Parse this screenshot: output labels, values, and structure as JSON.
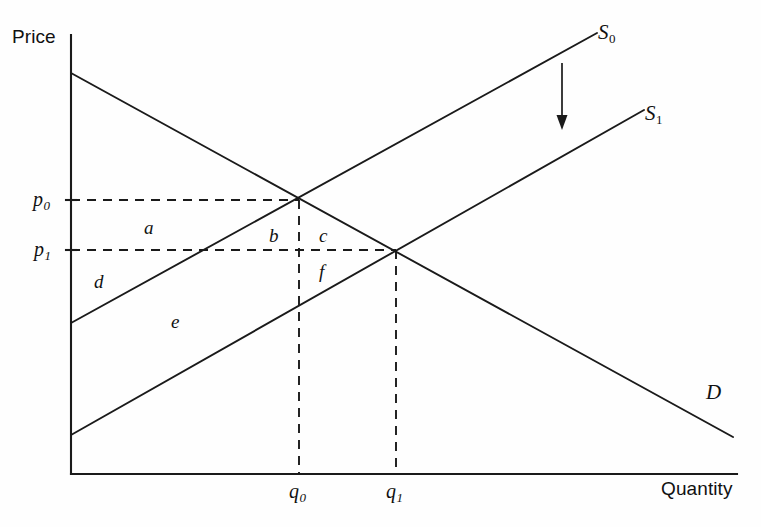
{
  "figure": {
    "background_color": "#fefefe",
    "line_color": "#1a1a1a"
  },
  "axes": {
    "y_label": "Price",
    "x_label": "Quantity",
    "origin": {
      "x": 71,
      "y": 474
    },
    "y_top": 35,
    "x_right": 737
  },
  "price_ticks": [
    {
      "key": "p0",
      "base": "p",
      "sub": "0",
      "y": 200
    },
    {
      "key": "p1",
      "base": "p",
      "sub": "1",
      "y": 250
    }
  ],
  "quantity_ticks": [
    {
      "key": "q0",
      "base": "q",
      "sub": "0",
      "x": 299
    },
    {
      "key": "q1",
      "base": "q",
      "sub": "1",
      "x": 396
    }
  ],
  "curves": [
    {
      "key": "supply0",
      "base": "S",
      "sub": "0",
      "label": "S0",
      "label_x": 598,
      "label_y": 22,
      "x1": 71,
      "y1": 323,
      "x2": 597,
      "y2": 33
    },
    {
      "key": "supply1",
      "base": "S",
      "sub": "1",
      "label": "S1",
      "label_x": 645,
      "label_y": 103,
      "x1": 71,
      "y1": 435,
      "x2": 644,
      "y2": 110
    },
    {
      "key": "demand",
      "base": "D",
      "sub": "",
      "label": "D",
      "label_x": 706,
      "label_y": 382,
      "x1": 71,
      "y1": 73,
      "x2": 733,
      "y2": 437
    }
  ],
  "equilibria": [
    {
      "key": "e0",
      "x": 299,
      "y": 200,
      "price": "p0",
      "quantity": "q0"
    },
    {
      "key": "e1",
      "x": 396,
      "y": 250,
      "price": "p1",
      "quantity": "q1"
    }
  ],
  "regions": [
    {
      "key": "a",
      "label": "a",
      "x": 144,
      "y": 218
    },
    {
      "key": "b",
      "label": "b",
      "x": 269,
      "y": 226
    },
    {
      "key": "c",
      "label": "c",
      "x": 319,
      "y": 226
    },
    {
      "key": "d",
      "label": "d",
      "x": 94,
      "y": 272
    },
    {
      "key": "e",
      "label": "e",
      "x": 171,
      "y": 312
    },
    {
      "key": "f",
      "label": "f",
      "x": 319,
      "y": 262
    }
  ],
  "shift_arrow": {
    "name": "supply-shift-arrow",
    "x": 562,
    "y_start": 63,
    "y_end": 130,
    "direction": "down"
  }
}
